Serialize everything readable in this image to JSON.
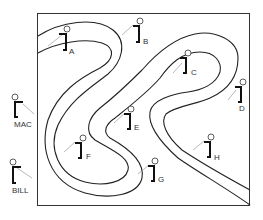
{
  "diagram": {
    "type": "winding-band-with-observers",
    "colors": {
      "line": "#222222",
      "background": "#ffffff",
      "sightline": "#999999"
    },
    "inside_observers": [
      {
        "id": "A",
        "label": "A"
      },
      {
        "id": "B",
        "label": "B"
      },
      {
        "id": "C",
        "label": "C"
      },
      {
        "id": "D",
        "label": "D"
      },
      {
        "id": "E",
        "label": "E"
      },
      {
        "id": "F",
        "label": "F"
      },
      {
        "id": "G",
        "label": "G"
      },
      {
        "id": "H",
        "label": "H"
      }
    ],
    "outside_observers": [
      {
        "id": "MAC",
        "label": "MAC"
      },
      {
        "id": "BILL",
        "label": "BILL"
      }
    ]
  }
}
